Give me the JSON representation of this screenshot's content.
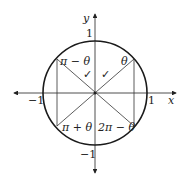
{
  "diagram": {
    "axes": {
      "x_label": "x",
      "y_label": "y",
      "x_pos_tick": "1",
      "x_neg_tick": "−1",
      "y_pos_tick": "1",
      "y_neg_tick": "−1"
    },
    "angle_labels": {
      "q1": "θ",
      "q2": "π − θ",
      "q3": "π + θ",
      "q4": "2π − θ"
    },
    "marks": {
      "left_check": "✓",
      "right_check": "✓"
    },
    "colors": {
      "stroke": "#222222",
      "circle": "#1a1a1a",
      "background": "#ffffff"
    }
  }
}
